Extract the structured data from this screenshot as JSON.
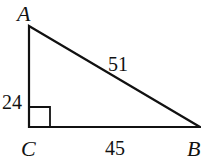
{
  "diagram": {
    "type": "right-triangle",
    "stroke_color": "#111111",
    "background": "#ffffff",
    "vertices": {
      "A": {
        "label": "A",
        "x": 29,
        "y": 26
      },
      "B": {
        "label": "B",
        "x": 200,
        "y": 127
      },
      "C": {
        "label": "C",
        "x": 29,
        "y": 127
      }
    },
    "sides": {
      "AC": {
        "label": "24"
      },
      "AB": {
        "label": "51"
      },
      "CB": {
        "label": "45"
      }
    },
    "right_angle_at": "C"
  }
}
